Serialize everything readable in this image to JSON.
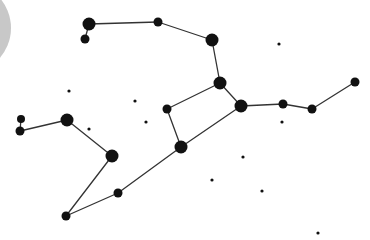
{
  "diagram": {
    "type": "constellation-map",
    "background": "#ffffff",
    "line_color": "#333333",
    "star_color": "#111111",
    "moon": {
      "cx": -35,
      "cy": 28,
      "r": 46,
      "color": "#c8c8c8"
    },
    "stars": [
      {
        "id": "A",
        "x": 89,
        "y": 24,
        "r": 6.5
      },
      {
        "id": "B",
        "x": 85,
        "y": 39,
        "r": 4.5
      },
      {
        "id": "C",
        "x": 158,
        "y": 22,
        "r": 4.5
      },
      {
        "id": "D",
        "x": 212,
        "y": 40,
        "r": 6.5
      },
      {
        "id": "E",
        "x": 220,
        "y": 83,
        "r": 6.5
      },
      {
        "id": "F",
        "x": 241,
        "y": 106,
        "r": 6.5
      },
      {
        "id": "G",
        "x": 283,
        "y": 104,
        "r": 4.5
      },
      {
        "id": "H",
        "x": 312,
        "y": 109,
        "r": 4.5
      },
      {
        "id": "I",
        "x": 355,
        "y": 82,
        "r": 4.5
      },
      {
        "id": "J",
        "x": 167,
        "y": 109,
        "r": 4.5
      },
      {
        "id": "K",
        "x": 181,
        "y": 147,
        "r": 6.5
      },
      {
        "id": "L",
        "x": 67,
        "y": 120,
        "r": 6.5
      },
      {
        "id": "M",
        "x": 21,
        "y": 119,
        "r": 4
      },
      {
        "id": "N",
        "x": 20,
        "y": 131,
        "r": 4.5
      },
      {
        "id": "O",
        "x": 112,
        "y": 156,
        "r": 6.5
      },
      {
        "id": "P",
        "x": 118,
        "y": 193,
        "r": 4.5
      },
      {
        "id": "Q",
        "x": 66,
        "y": 216,
        "r": 4.5
      }
    ],
    "faint_stars": [
      {
        "x": 279,
        "y": 44
      },
      {
        "x": 69,
        "y": 91
      },
      {
        "x": 135,
        "y": 101
      },
      {
        "x": 89,
        "y": 129
      },
      {
        "x": 146,
        "y": 122
      },
      {
        "x": 282,
        "y": 122
      },
      {
        "x": 243,
        "y": 157
      },
      {
        "x": 212,
        "y": 180
      },
      {
        "x": 262,
        "y": 191
      },
      {
        "x": 318,
        "y": 233
      }
    ],
    "lines": [
      [
        "A",
        "B"
      ],
      [
        "A",
        "C"
      ],
      [
        "C",
        "D"
      ],
      [
        "D",
        "E"
      ],
      [
        "E",
        "F"
      ],
      [
        "E",
        "J"
      ],
      [
        "J",
        "K"
      ],
      [
        "F",
        "K"
      ],
      [
        "F",
        "G"
      ],
      [
        "G",
        "H"
      ],
      [
        "H",
        "I"
      ],
      [
        "K",
        "P"
      ],
      [
        "P",
        "Q"
      ],
      [
        "Q",
        "O"
      ],
      [
        "O",
        "L"
      ],
      [
        "L",
        "N"
      ],
      [
        "N",
        "M"
      ]
    ]
  }
}
